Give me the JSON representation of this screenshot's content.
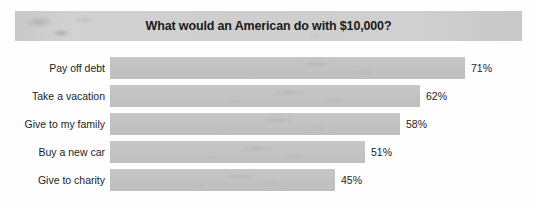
{
  "chart_data": {
    "type": "bar",
    "orientation": "horizontal",
    "title": "What would an American do with $10,000?",
    "xlabel": "",
    "ylabel": "",
    "xlim": [
      0,
      100
    ],
    "grid": false,
    "legend": false,
    "value_suffix": "%",
    "categories": [
      "Pay off debt",
      "Take a vacation",
      "Give to my family",
      "Buy a new car",
      "Give to charity"
    ],
    "values": [
      71,
      62,
      58,
      51,
      45
    ],
    "bars": [
      {
        "label": "Pay off debt",
        "value": 71,
        "value_label": "71%"
      },
      {
        "label": "Take a vacation",
        "value": 62,
        "value_label": "62%"
      },
      {
        "label": "Give to my family",
        "value": 58,
        "value_label": "58%"
      },
      {
        "label": "Buy a new car",
        "value": 51,
        "value_label": "51%"
      },
      {
        "label": "Give to charity",
        "value": 45,
        "value_label": "45%"
      }
    ],
    "colors": {
      "bar_fill": "#c3c3c3",
      "title_banner": "#cfcfcf",
      "text": "#1d1d1d",
      "background": "#ffffff"
    }
  }
}
